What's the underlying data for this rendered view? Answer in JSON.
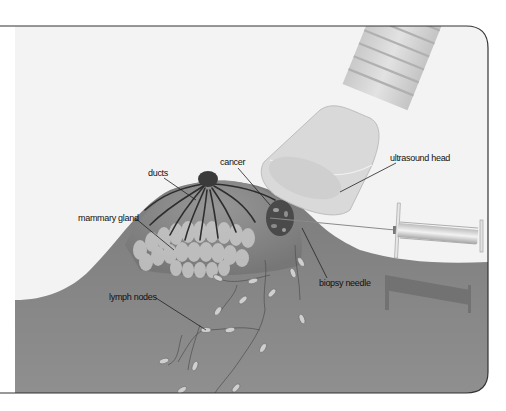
{
  "figure": {
    "colors": {
      "background": "#f3f3f3",
      "tissue": "#757575",
      "tissue_light": "#8a8a8a",
      "frame": "#333333",
      "probe": "#d6d6d6",
      "label_text": "#111111",
      "leader_line": "#222222"
    }
  },
  "labels": {
    "ducts": "ducts",
    "cancer": "cancer",
    "ultrasound_head": "ultrasound head",
    "mammary_gland": "mammary gland",
    "biopsy_needle": "biopsy needle",
    "lymph_nodes": "lymph nodes"
  }
}
